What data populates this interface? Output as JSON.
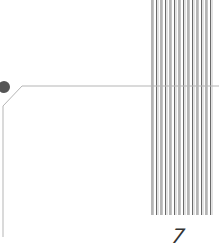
{
  "diagram": {
    "node": {
      "cx": 4,
      "cy": 87,
      "r": 6,
      "color": "#555555"
    },
    "connector": {
      "color": "#b5b5b5",
      "points": [
        [
          219,
          86
        ],
        [
          22,
          86
        ],
        [
          3,
          106
        ],
        [
          3,
          237
        ]
      ]
    },
    "bus_lines": {
      "count": 14,
      "x_start": 152,
      "spacing": 4.5,
      "y_top": 0,
      "y_bottom": 215,
      "color_dark": "#6a6a6a",
      "color_light": "#b8b8b8"
    },
    "label": "7"
  }
}
